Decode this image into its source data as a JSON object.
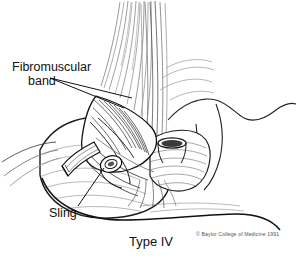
{
  "figure": {
    "caption": "Type IV",
    "copyright": "© Baylor College of Medicine 1991",
    "background_color": "#ffffff",
    "ink_color": "#111111"
  },
  "labels": {
    "fibromuscular": {
      "line1": "Fibromuscular",
      "line2": "band"
    },
    "sling": {
      "text": "Sling"
    }
  },
  "parts": {
    "esophageal_muscle_bundle": "longitudinal esophageal muscle fibers",
    "fibromuscular_band": "fibromuscular band fanning over the junction",
    "sling_fibers": "gastric sling fibers",
    "vessel_stump_left": "cut vessel stump left",
    "vessel_stump_mid": "cut vessel lumen mid",
    "vessel_stump_right": "cut vessel stump right",
    "stomach_body": "stomach fundus and greater curvature",
    "diaphragm_contour": "diaphragmatic crus contour"
  }
}
